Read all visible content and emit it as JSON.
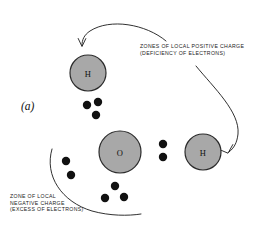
{
  "figure": {
    "panel_letter": "(a)",
    "background_color": "#ffffff",
    "atom_fill_color": "#a8a8a8",
    "atom_stroke_color": "#2b2b2b",
    "electron_color": "#111111",
    "line_color": "#1a1a1a"
  },
  "atoms": [
    {
      "name": "hydrogen-top",
      "label": "H",
      "cx": 88,
      "cy": 73,
      "r": 18
    },
    {
      "name": "oxygen-center",
      "label": "O",
      "cx": 120,
      "cy": 152,
      "r": 21
    },
    {
      "name": "hydrogen-right",
      "label": "H",
      "cx": 203,
      "cy": 152,
      "r": 18
    }
  ],
  "electrons": [
    {
      "cluster": "upper-pair",
      "cx": 87,
      "cy": 105,
      "r": 4.2
    },
    {
      "cluster": "upper-pair",
      "cx": 98,
      "cy": 102,
      "r": 4.2
    },
    {
      "cluster": "upper-pair",
      "cx": 96,
      "cy": 115,
      "r": 4.2
    },
    {
      "cluster": "right-pair",
      "cx": 163,
      "cy": 144,
      "r": 4.2
    },
    {
      "cluster": "right-pair",
      "cx": 163,
      "cy": 157,
      "r": 4.2
    },
    {
      "cluster": "lower-left",
      "cx": 66,
      "cy": 161,
      "r": 4.2
    },
    {
      "cluster": "lower-left",
      "cx": 71,
      "cy": 175,
      "r": 4.2
    },
    {
      "cluster": "bottom",
      "cx": 115,
      "cy": 186,
      "r": 4.2
    },
    {
      "cluster": "bottom",
      "cx": 105,
      "cy": 198,
      "r": 4.2
    },
    {
      "cluster": "bottom",
      "cx": 124,
      "cy": 197,
      "r": 4.2
    }
  ],
  "labels": {
    "positive_zone": {
      "line1": "ZONES OF LOCAL POSITIVE CHARGE",
      "line2": "(DEFICIENCY OF ELECTRONS)"
    },
    "negative_zone": {
      "line1": "ZONE  OF LOCAL",
      "line2": "NEGATIVE CHARGE",
      "line3": "(EXCESS OF ELECTRONS)"
    }
  },
  "annotations": {
    "arrow_to_top_hydrogen": "curved arrow from caption to top hydrogen zone",
    "arrow_to_right_hydrogen": "curved arrow from caption to right hydrogen zone",
    "arc_negative_zone": "arc enclosing the zone of local negative charge"
  }
}
